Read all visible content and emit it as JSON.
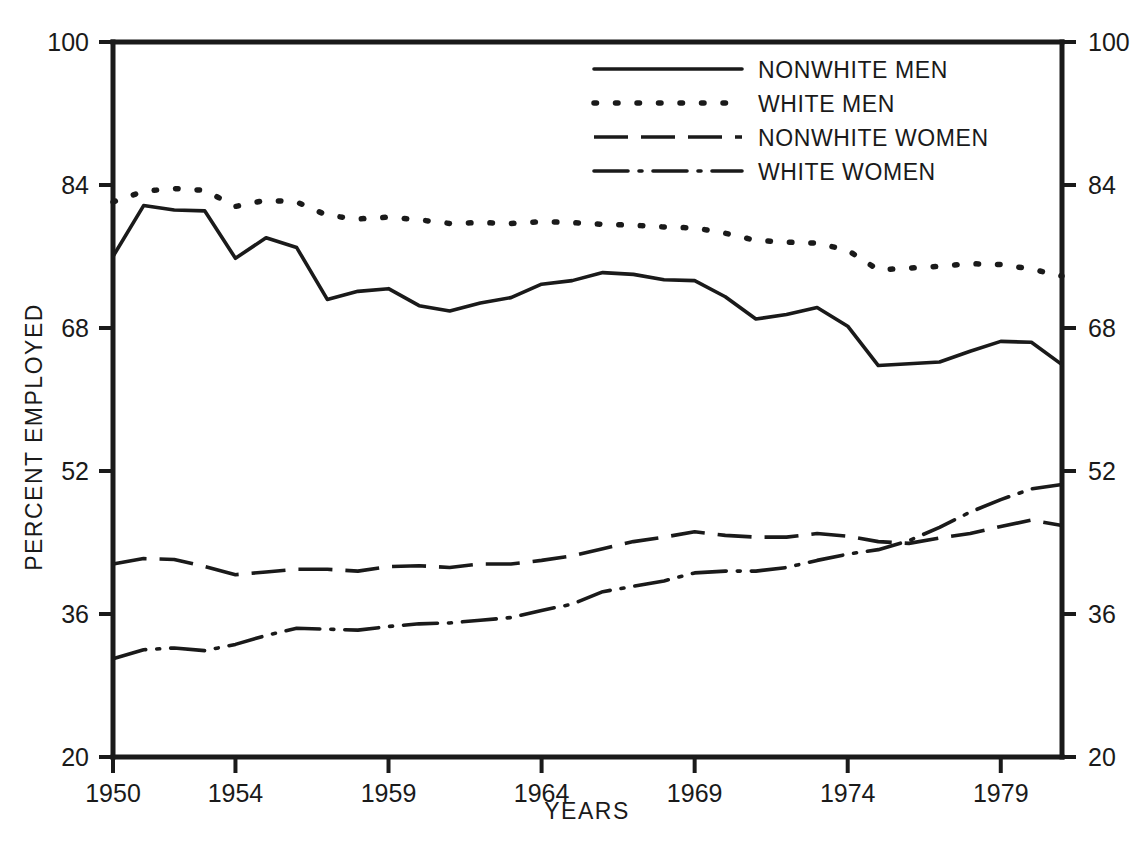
{
  "chart_data": {
    "type": "line",
    "title": "",
    "xlabel": "YEARS",
    "ylabel": "PERCENT EMPLOYED",
    "xlim": [
      1950,
      1981
    ],
    "ylim": [
      20,
      100
    ],
    "grid": false,
    "legend_position": "top-right inside plot",
    "y_ticks": [
      20,
      36,
      52,
      68,
      84,
      100
    ],
    "y_ticks_right": [
      20,
      36,
      52,
      68,
      84,
      100
    ],
    "x_ticks": [
      1950,
      1954,
      1959,
      1964,
      1969,
      1974,
      1979
    ],
    "x": [
      1950,
      1951,
      1952,
      1953,
      1954,
      1955,
      1956,
      1957,
      1958,
      1959,
      1960,
      1961,
      1962,
      1963,
      1964,
      1965,
      1966,
      1967,
      1968,
      1969,
      1970,
      1971,
      1972,
      1973,
      1974,
      1975,
      1976,
      1977,
      1978,
      1979,
      1980,
      1981
    ],
    "series": [
      {
        "name": "NONWHITE MEN",
        "style": "solid",
        "values": [
          76.0,
          81.7,
          81.2,
          81.1,
          75.8,
          78.1,
          77.0,
          71.2,
          72.1,
          72.4,
          70.5,
          69.9,
          70.8,
          71.4,
          72.9,
          73.3,
          74.2,
          74.0,
          73.4,
          73.3,
          71.5,
          69.0,
          69.5,
          70.3,
          68.2,
          63.8,
          64.0,
          64.2,
          65.4,
          66.5,
          66.4,
          63.9
        ]
      },
      {
        "name": "WHITE MEN",
        "style": "dotted",
        "values": [
          82.1,
          83.3,
          83.6,
          83.4,
          81.6,
          82.3,
          82.1,
          80.6,
          80.2,
          80.4,
          80.1,
          79.7,
          79.8,
          79.7,
          79.9,
          79.8,
          79.6,
          79.5,
          79.3,
          79.2,
          78.6,
          77.8,
          77.6,
          77.5,
          76.7,
          74.5,
          74.7,
          74.9,
          75.2,
          75.1,
          74.6,
          73.8
        ]
      },
      {
        "name": "NONWHITE WOMEN",
        "style": "dashed",
        "values": [
          41.6,
          42.2,
          42.1,
          41.3,
          40.4,
          40.7,
          41.0,
          41.0,
          40.8,
          41.3,
          41.4,
          41.2,
          41.6,
          41.6,
          42.0,
          42.5,
          43.3,
          44.1,
          44.6,
          45.2,
          44.8,
          44.6,
          44.6,
          45.0,
          44.7,
          44.1,
          43.9,
          44.5,
          45.0,
          45.8,
          46.5,
          45.9
        ]
      },
      {
        "name": "WHITE WOMEN",
        "style": "dash-dot",
        "values": [
          31.0,
          32.0,
          32.2,
          31.9,
          32.6,
          33.6,
          34.4,
          34.3,
          34.2,
          34.6,
          34.9,
          35.0,
          35.3,
          35.6,
          36.4,
          37.1,
          38.5,
          39.1,
          39.7,
          40.6,
          40.8,
          40.8,
          41.2,
          42.0,
          42.7,
          43.2,
          44.2,
          45.7,
          47.4,
          48.8,
          50.0,
          50.5
        ]
      }
    ]
  }
}
